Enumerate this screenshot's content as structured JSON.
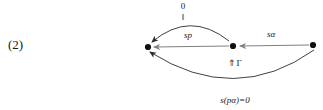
{
  "figure": {
    "equation_number": "(2)",
    "kind": "commutative-diagram"
  },
  "nodes": [
    {
      "id": "left",
      "name": "node-left",
      "x": 148,
      "y": 47
    },
    {
      "id": "middle",
      "name": "node-middle",
      "x": 233,
      "y": 46
    },
    {
      "id": "right",
      "name": "node-right",
      "x": 313,
      "y": 45
    }
  ],
  "arrows": [
    {
      "id": "top-arc",
      "name": "arrow-top-arc",
      "from": "middle",
      "to": "left",
      "shape": "arc-up",
      "label": "0",
      "label_secondary": "‖"
    },
    {
      "id": "sp",
      "name": "arrow-sp",
      "from": "middle",
      "to": "left",
      "shape": "straight",
      "label": "sp"
    },
    {
      "id": "salpha",
      "name": "arrow-s-alpha",
      "from": "right",
      "to": "middle",
      "shape": "straight",
      "label": "sα"
    },
    {
      "id": "bottom-arc",
      "name": "arrow-bottom-arc",
      "from": "right",
      "to": "left",
      "shape": "arc-down",
      "label": "s(pα)=0"
    }
  ],
  "two_cells": [
    {
      "id": "gamma",
      "name": "two-cell-gamma",
      "label": "⇑Γ"
    }
  ],
  "colors": {
    "ink": "#1a1a1a",
    "arrow_gray": "#808080",
    "curve": "#2b2b2b",
    "background": "#ffffff"
  }
}
